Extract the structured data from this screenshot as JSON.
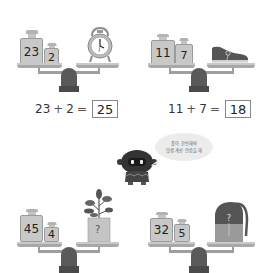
{
  "problems": [
    {
      "id": "top-left",
      "weights": [
        "23",
        "2"
      ],
      "object": "alarm-clock",
      "equation": {
        "a": "23",
        "op": "+",
        "b": "2",
        "eq": "=",
        "answer": "25"
      }
    },
    {
      "id": "top-right",
      "weights": [
        "11",
        "7"
      ],
      "object": "sneaker",
      "equation": {
        "a": "11",
        "op": "+",
        "b": "7",
        "eq": "=",
        "answer": "18"
      }
    },
    {
      "id": "bottom-left",
      "weights": [
        "45",
        "4"
      ],
      "object": "potted-plant",
      "object_label": "?"
    },
    {
      "id": "bottom-right",
      "weights": [
        "32",
        "5"
      ],
      "object": "backpack",
      "object_label": "?"
    }
  ],
  "robot": {
    "speech_line1": "좋아 한번해봐",
    "speech_line2": "덧셈 계산 연습을 해"
  }
}
